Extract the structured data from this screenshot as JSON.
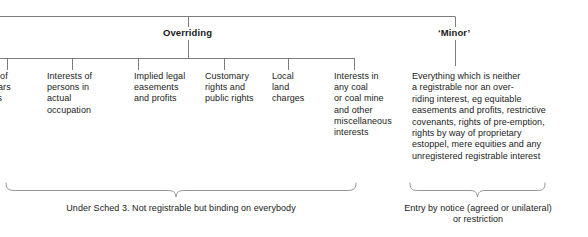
{
  "diagram": {
    "line_color": "#6e6e6e",
    "text_color": "#1a1a1a",
    "background": "#ffffff"
  },
  "branches": [
    {
      "id": "overriding",
      "label": "Overriding"
    },
    {
      "id": "minor",
      "label": "‘Minor’"
    }
  ],
  "overriding_leaves": [
    {
      "id": "leases",
      "text": "s of\nears\nss",
      "clipped": true
    },
    {
      "id": "interests-of-persons-in-actual-occupation",
      "text": "Interests of\npersons in\nactual\noccupation"
    },
    {
      "id": "implied-legal-easements-and-profits",
      "text": "Implied legal\neasements\nand profits"
    },
    {
      "id": "customary-rights-and-public-rights",
      "text": "Customary\nrights and\npublic rights"
    },
    {
      "id": "local-land-charges",
      "text": "Local\nland\ncharges"
    },
    {
      "id": "interests-in-any-coal",
      "text": "Interests in\nany coal\nor coal mine\nand other\nmiscellaneous\ninterests"
    }
  ],
  "minor_leaf": {
    "id": "minor-description",
    "text": "Everything which is neither\na registrable nor an over-\nriding interest, eg equitable\neasements and profits, restrictive\ncovenants, rights of pre-emption,\nrights by way of proprietary\nestoppel, mere equities and any\nunregistered registrable interest"
  },
  "brace_captions": [
    {
      "id": "overriding-caption",
      "text": "Under Sched 3. Not registrable but binding on everybody"
    },
    {
      "id": "minor-caption",
      "text": "Entry by notice (agreed or unilateral)\nor restriction"
    }
  ]
}
